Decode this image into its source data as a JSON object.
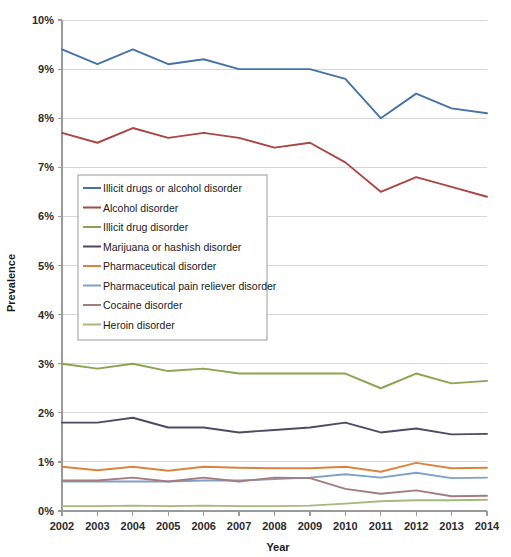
{
  "chart_data": {
    "type": "line",
    "title": "",
    "xlabel": "Year",
    "ylabel": "Prevalence",
    "categories": [
      "2002",
      "2003",
      "2004",
      "2005",
      "2006",
      "2007",
      "2008",
      "2009",
      "2010",
      "2011",
      "2012",
      "2013",
      "2014"
    ],
    "x": [
      2002,
      2003,
      2004,
      2005,
      2006,
      2007,
      2008,
      2009,
      2010,
      2011,
      2012,
      2013,
      2014
    ],
    "ylim": [
      0,
      10
    ],
    "ytick_labels": [
      "0%",
      "1%",
      "2%",
      "3%",
      "4%",
      "5%",
      "6%",
      "7%",
      "8%",
      "9%",
      "10%"
    ],
    "ytick_values": [
      0,
      1,
      2,
      3,
      4,
      5,
      6,
      7,
      8,
      9,
      10
    ],
    "grid": true,
    "legend_position": "inside-upper-left",
    "series": [
      {
        "name": "Illicit drugs or alcohol disorder",
        "color": "#4573a7",
        "values": [
          9.4,
          9.1,
          9.4,
          9.1,
          9.2,
          9.0,
          9.0,
          9.0,
          8.8,
          8.0,
          8.5,
          8.2,
          8.1
        ]
      },
      {
        "name": "Alcohol disorder",
        "color": "#aa4643",
        "values": [
          7.7,
          7.5,
          7.8,
          7.6,
          7.7,
          7.6,
          7.4,
          7.5,
          7.1,
          6.5,
          6.8,
          6.6,
          6.4
        ]
      },
      {
        "name": "Illicit drug disorder",
        "color": "#89a54e",
        "values": [
          3.0,
          2.9,
          3.0,
          2.85,
          2.9,
          2.8,
          2.8,
          2.8,
          2.8,
          2.5,
          2.8,
          2.6,
          2.65
        ]
      },
      {
        "name": "Marijuana or hashish disorder",
        "color": "#4f4a64",
        "values": [
          1.8,
          1.8,
          1.9,
          1.7,
          1.7,
          1.6,
          1.65,
          1.7,
          1.8,
          1.6,
          1.68,
          1.56,
          1.57
        ]
      },
      {
        "name": "Pharmaceutical disorder",
        "color": "#db843d",
        "values": [
          0.9,
          0.83,
          0.9,
          0.82,
          0.9,
          0.88,
          0.87,
          0.87,
          0.9,
          0.8,
          0.98,
          0.87,
          0.88
        ]
      },
      {
        "name": "Pharmaceutical pain reliever disorder",
        "color": "#80a0c7",
        "values": [
          0.6,
          0.6,
          0.6,
          0.6,
          0.62,
          0.62,
          0.65,
          0.68,
          0.75,
          0.68,
          0.78,
          0.67,
          0.68
        ]
      },
      {
        "name": "Cocaine disorder",
        "color": "#a57c7c",
        "values": [
          0.62,
          0.62,
          0.68,
          0.6,
          0.68,
          0.6,
          0.68,
          0.67,
          0.45,
          0.35,
          0.42,
          0.3,
          0.31
        ]
      },
      {
        "name": "Heroin disorder",
        "color": "#a4b97d",
        "values": [
          0.1,
          0.1,
          0.11,
          0.1,
          0.11,
          0.1,
          0.1,
          0.11,
          0.15,
          0.2,
          0.22,
          0.22,
          0.23
        ]
      }
    ]
  },
  "axes": {
    "y_title": "Prevalence",
    "x_title": "Year"
  }
}
